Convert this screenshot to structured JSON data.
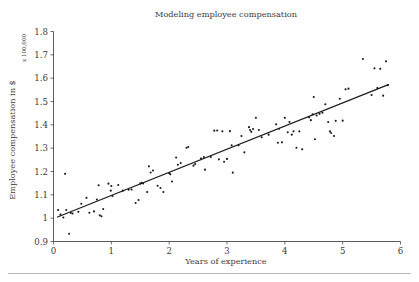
{
  "chart_data": {
    "type": "scatter",
    "title": "Modeling employee compensation",
    "xlabel": "Years of experience",
    "ylabel": "Employee compensation in $",
    "ylabel_units": "x 100,000",
    "xlim": [
      0,
      6
    ],
    "ylim": [
      0.9,
      1.8
    ],
    "xticks": [
      0,
      1,
      2,
      3,
      4,
      5,
      6
    ],
    "xtick_labels": [
      "0",
      "1",
      "2",
      "3",
      "4",
      "5",
      "6"
    ],
    "yticks": [
      0.9,
      1.0,
      1.1,
      1.2,
      1.3,
      1.4,
      1.5,
      1.6,
      1.7,
      1.8
    ],
    "ytick_labels": [
      "0.9",
      "1",
      "1.1",
      "1.2",
      "1.3",
      "1.4",
      "1.5",
      "1.6",
      "1.7",
      "1.8"
    ],
    "grid": false,
    "legend": false,
    "series": [
      {
        "name": "Employees",
        "marker": "dot",
        "color": "#1a1a1a",
        "points": [
          [
            0.08,
            1.035
          ],
          [
            0.12,
            1.015
          ],
          [
            0.17,
            1.003
          ],
          [
            0.2,
            1.19
          ],
          [
            0.22,
            1.035
          ],
          [
            0.27,
            0.933
          ],
          [
            0.3,
            1.022
          ],
          [
            0.33,
            1.02
          ],
          [
            0.43,
            1.027
          ],
          [
            0.48,
            1.062
          ],
          [
            0.57,
            1.087
          ],
          [
            0.62,
            1.023
          ],
          [
            0.7,
            1.029
          ],
          [
            0.75,
            1.08
          ],
          [
            0.78,
            1.141
          ],
          [
            0.8,
            1.012
          ],
          [
            0.83,
            1.008
          ],
          [
            0.86,
            1.039
          ],
          [
            0.95,
            1.148
          ],
          [
            0.99,
            1.118
          ],
          [
            1.0,
            1.138
          ],
          [
            1.02,
            1.095
          ],
          [
            1.12,
            1.142
          ],
          [
            1.2,
            1.118
          ],
          [
            1.3,
            1.122
          ],
          [
            1.35,
            1.123
          ],
          [
            1.42,
            1.065
          ],
          [
            1.47,
            1.078
          ],
          [
            1.5,
            1.148
          ],
          [
            1.52,
            1.152
          ],
          [
            1.55,
            1.149
          ],
          [
            1.62,
            1.112
          ],
          [
            1.65,
            1.222
          ],
          [
            1.68,
            1.196
          ],
          [
            1.72,
            1.204
          ],
          [
            1.8,
            1.139
          ],
          [
            1.85,
            1.129
          ],
          [
            1.9,
            1.112
          ],
          [
            2.0,
            1.193
          ],
          [
            2.02,
            1.188
          ],
          [
            2.05,
            1.157
          ],
          [
            2.12,
            1.26
          ],
          [
            2.15,
            1.229
          ],
          [
            2.2,
            1.236
          ],
          [
            2.3,
            1.302
          ],
          [
            2.33,
            1.305
          ],
          [
            2.42,
            1.225
          ],
          [
            2.45,
            1.232
          ],
          [
            2.55,
            1.256
          ],
          [
            2.6,
            1.262
          ],
          [
            2.62,
            1.208
          ],
          [
            2.72,
            1.262
          ],
          [
            2.78,
            1.375
          ],
          [
            2.83,
            1.376
          ],
          [
            2.86,
            1.252
          ],
          [
            2.92,
            1.372
          ],
          [
            2.95,
            1.242
          ],
          [
            3.0,
            1.254
          ],
          [
            3.05,
            1.373
          ],
          [
            3.08,
            1.312
          ],
          [
            3.1,
            1.195
          ],
          [
            3.2,
            1.312
          ],
          [
            3.25,
            1.352
          ],
          [
            3.3,
            1.282
          ],
          [
            3.38,
            1.39
          ],
          [
            3.4,
            1.378
          ],
          [
            3.42,
            1.37
          ],
          [
            3.45,
            1.382
          ],
          [
            3.5,
            1.43
          ],
          [
            3.55,
            1.378
          ],
          [
            3.6,
            1.347
          ],
          [
            3.72,
            1.358
          ],
          [
            3.85,
            1.402
          ],
          [
            3.88,
            1.323
          ],
          [
            3.9,
            1.383
          ],
          [
            3.95,
            1.325
          ],
          [
            4.0,
            1.43
          ],
          [
            4.05,
            1.368
          ],
          [
            4.08,
            1.412
          ],
          [
            4.12,
            1.358
          ],
          [
            4.15,
            1.372
          ],
          [
            4.2,
            1.302
          ],
          [
            4.25,
            1.372
          ],
          [
            4.3,
            1.295
          ],
          [
            4.42,
            1.432
          ],
          [
            4.45,
            1.42
          ],
          [
            4.48,
            1.445
          ],
          [
            4.5,
            1.519
          ],
          [
            4.52,
            1.338
          ],
          [
            4.55,
            1.44
          ],
          [
            4.6,
            1.447
          ],
          [
            4.65,
            1.452
          ],
          [
            4.7,
            1.488
          ],
          [
            4.75,
            1.412
          ],
          [
            4.78,
            1.372
          ],
          [
            4.8,
            1.365
          ],
          [
            4.85,
            1.352
          ],
          [
            4.88,
            1.417
          ],
          [
            4.95,
            1.512
          ],
          [
            5.0,
            1.418
          ],
          [
            5.05,
            1.552
          ],
          [
            5.1,
            1.555
          ],
          [
            5.35,
            1.682
          ],
          [
            5.5,
            1.528
          ],
          [
            5.55,
            1.642
          ],
          [
            5.6,
            1.558
          ],
          [
            5.65,
            1.64
          ],
          [
            5.7,
            1.525
          ],
          [
            5.75,
            1.672
          ],
          [
            5.78,
            1.57
          ]
        ]
      }
    ],
    "trendline": {
      "name": "Linear fit",
      "color": "#1d1d1d",
      "x_start": 0.07,
      "y_start": 1.005,
      "x_end": 5.79,
      "y_end": 1.572
    }
  }
}
